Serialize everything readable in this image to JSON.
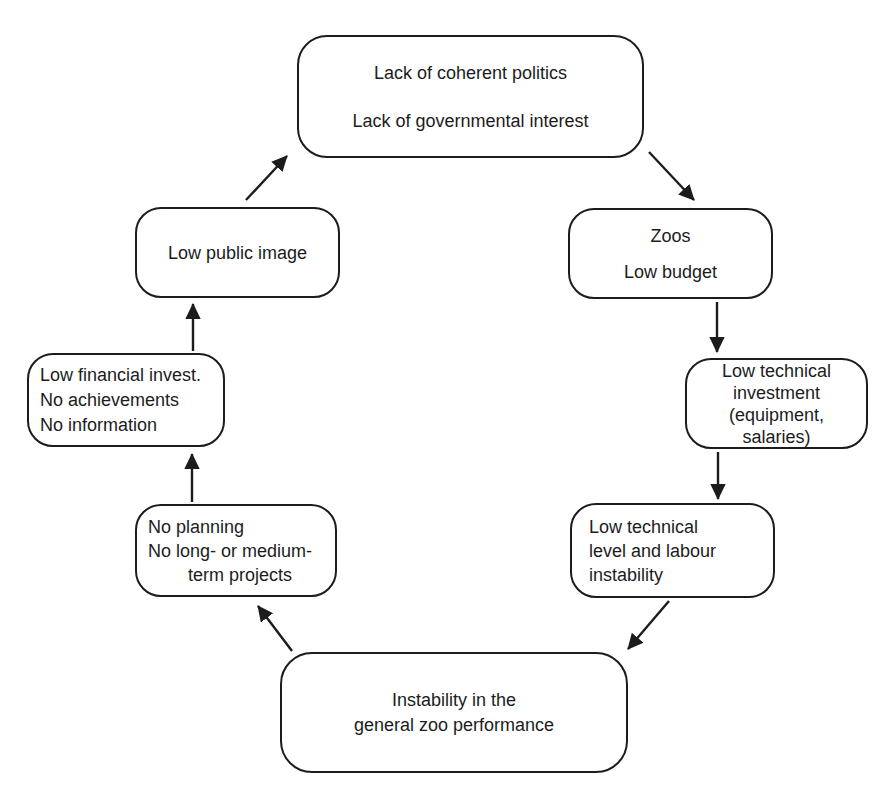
{
  "diagram": {
    "type": "cycle-flow",
    "background_color": "#ffffff",
    "stroke_color": "#1c1c1c",
    "text_color": "#1c1c1c",
    "nodes": {
      "politics": {
        "text": "Lack of coherent politics\n\nLack of governmental interest"
      },
      "zoos": {
        "text": "Zoos\nLow budget"
      },
      "investment": {
        "text": "Low technical\ninvestment\n(equipment,\nsalaries)"
      },
      "level": {
        "text": "Low technical\nlevel and labour\ninstability"
      },
      "performance": {
        "text": "Instability in the\ngeneral zoo performance"
      },
      "planning": {
        "text": "No planning\nNo long- or medium-\n        term projects"
      },
      "financial": {
        "text": "Low financial invest.\nNo achievements\nNo information"
      },
      "image": {
        "text": "Low public image"
      }
    },
    "edges": [
      {
        "from": "politics",
        "to": "zoos"
      },
      {
        "from": "zoos",
        "to": "investment"
      },
      {
        "from": "investment",
        "to": "level"
      },
      {
        "from": "level",
        "to": "performance"
      },
      {
        "from": "performance",
        "to": "planning"
      },
      {
        "from": "planning",
        "to": "financial"
      },
      {
        "from": "financial",
        "to": "image"
      },
      {
        "from": "image",
        "to": "politics"
      }
    ]
  }
}
